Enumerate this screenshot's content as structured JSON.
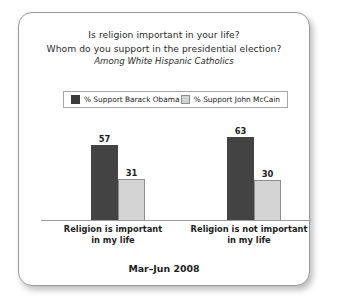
{
  "panel": {
    "title_lines": [
      "Is religion important in your life?",
      "Whom do you support in the presidential election?"
    ],
    "subtitle": "Among White Hispanic Catholics",
    "footer": "Mar–Jun 2008"
  },
  "legend": {
    "items": [
      {
        "label": "% Support Barack Obama",
        "color": "#3b3b3b"
      },
      {
        "label": "% Support John McCain",
        "color": "#d2d2d2"
      }
    ]
  },
  "chart_data": {
    "type": "bar",
    "title": "Is religion important in your life? Whom do you support in the presidential election?",
    "subtitle": "Among White Hispanic Catholics",
    "categories": [
      "Religion is important in my life",
      "Religion is not important in my life"
    ],
    "category_lines": [
      [
        "Religion is important",
        "in my life"
      ],
      [
        "Religion is not important",
        "in my life"
      ]
    ],
    "series": [
      {
        "name": "% Support Barack Obama",
        "color": "#434343",
        "values": [
          57,
          31
        ]
      },
      {
        "name": "% Support John McCain",
        "color": "#d4d4d4",
        "values": [
          63,
          30
        ]
      }
    ],
    "grouped_values": [
      {
        "category": "Religion is important in my life",
        "obama": 57,
        "mccain": 31
      },
      {
        "category": "Religion is not important in my life",
        "obama": 63,
        "mccain": 30
      }
    ],
    "xlabel": "",
    "ylabel": "",
    "ylim": [
      0,
      75
    ],
    "grid": false,
    "legend_position": "top",
    "footnote": "Mar–Jun 2008"
  }
}
